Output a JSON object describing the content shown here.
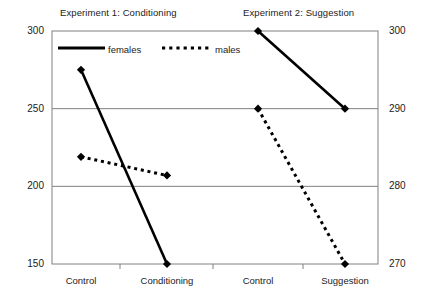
{
  "chart_data": {
    "type": "line",
    "title": "",
    "panels": [
      {
        "name": "experiment-1",
        "title": "Experiment 1: Conditioning",
        "categories": [
          "Control",
          "Conditioning"
        ],
        "axis": "left",
        "series": [
          {
            "name": "females",
            "style": "solid",
            "values": [
              275,
              150
            ]
          },
          {
            "name": "males",
            "style": "dotted",
            "values": [
              219,
              207
            ]
          }
        ]
      },
      {
        "name": "experiment-2",
        "title": "Experiment 2: Suggestion",
        "categories": [
          "Control",
          "Suggestion"
        ],
        "axis": "right",
        "series": [
          {
            "name": "females",
            "style": "solid",
            "values": [
              300,
              290
            ]
          },
          {
            "name": "males",
            "style": "dotted",
            "values": [
              290,
              270
            ]
          }
        ]
      }
    ],
    "legend": {
      "position": "top-left-inside",
      "entries": [
        {
          "label": "females",
          "style": "solid"
        },
        {
          "label": "males",
          "style": "dotted"
        }
      ]
    },
    "left_axis": {
      "label": "",
      "ticks": [
        "300",
        "250",
        "200",
        "150"
      ],
      "ylim": [
        150,
        300
      ],
      "tick_values": [
        300,
        250,
        200,
        150
      ]
    },
    "right_axis": {
      "label": "",
      "ticks": [
        "300",
        "290",
        "280",
        "270"
      ],
      "ylim": [
        270,
        300
      ],
      "tick_values": [
        300,
        290,
        280,
        270
      ]
    },
    "xlabel": "",
    "x_tick_labels": [
      "Control",
      "Conditioning",
      "Control",
      "Suggestion"
    ],
    "grid": true,
    "colors": {
      "line": "#000000",
      "grid": "#808080",
      "frame": "#808080",
      "text": "#1b1b1b",
      "background": "#ffffff"
    }
  }
}
